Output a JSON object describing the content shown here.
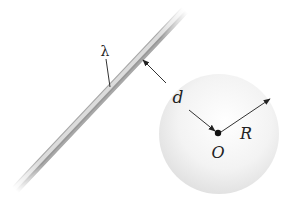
{
  "diagram": {
    "type": "physics",
    "rod": {
      "label": "λ",
      "start": [
        15,
        190
      ],
      "end": [
        185,
        10
      ],
      "color": "#b0b0b0"
    },
    "sphere": {
      "center": [
        219,
        134
      ],
      "radius": 60,
      "fill": "#f0f0f0",
      "center_label": "O"
    },
    "arrows": [
      {
        "name": "distance",
        "label": "d",
        "from": [
          142,
          59
        ],
        "to": [
          217,
          132
        ]
      },
      {
        "name": "radius",
        "label": "R",
        "from": [
          219,
          133
        ],
        "to": [
          270,
          99
        ]
      }
    ],
    "labels": {
      "lambda": "λ",
      "d": "d",
      "R": "R",
      "O": "O"
    },
    "label_positions": {
      "lambda": [
        105,
        50
      ],
      "d": [
        178,
        98
      ],
      "R": [
        246,
        135
      ],
      "O": [
        218,
        153
      ]
    },
    "colors": {
      "line": "#333333",
      "dot": "#111111",
      "text": "#222222"
    }
  }
}
